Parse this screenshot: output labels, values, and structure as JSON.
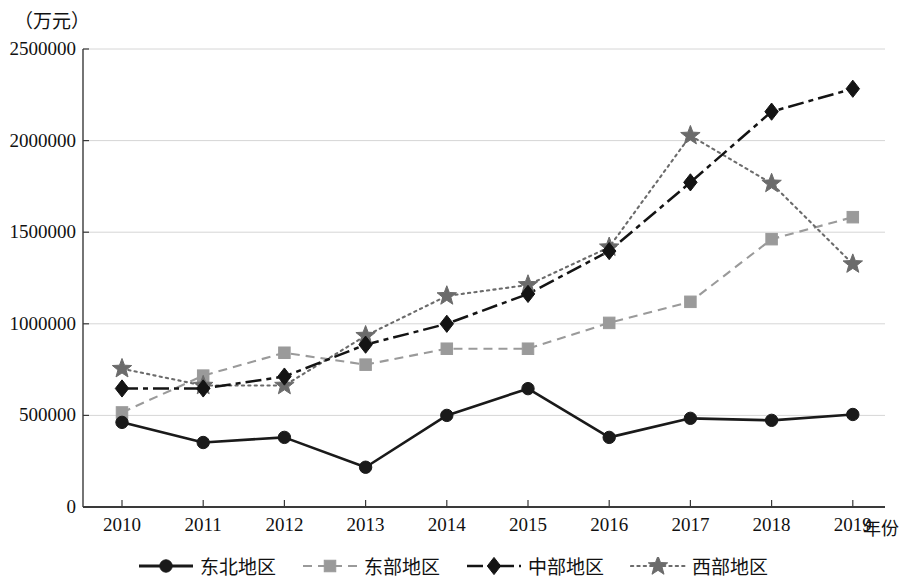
{
  "chart_data": {
    "type": "line",
    "title": "",
    "subtitle": "",
    "xlabel": "年份",
    "ylabel": "（万元）",
    "x": [
      "2010",
      "2011",
      "2012",
      "2013",
      "2014",
      "2015",
      "2016",
      "2017",
      "2018",
      "2019"
    ],
    "categories": [
      "2010",
      "2011",
      "2012",
      "2013",
      "2014",
      "2015",
      "2016",
      "2017",
      "2018",
      "2019"
    ],
    "ylim": [
      0,
      2500000
    ],
    "yticks": [
      "0",
      "500000",
      "1000000",
      "1500000",
      "2000000",
      "2500000"
    ],
    "ytick_values": [
      0,
      500000,
      1000000,
      1500000,
      2000000,
      2500000
    ],
    "grid": "horizontal",
    "legend_position": "bottom",
    "series": [
      {
        "name": "东北地区",
        "marker": "circle",
        "linestyle": "solid",
        "color": "#1a1a1a",
        "values": [
          462000,
          352000,
          380000,
          217000,
          500000,
          646000,
          380000,
          484000,
          473000,
          505000
        ]
      },
      {
        "name": "东部地区",
        "marker": "square",
        "linestyle": "dashed",
        "color": "#9a9a9a",
        "values": [
          516000,
          717000,
          842000,
          777000,
          864000,
          864000,
          1005000,
          1120000,
          1462000,
          1582000
        ]
      },
      {
        "name": "中部地区",
        "marker": "diamond",
        "linestyle": "dashdot",
        "color": "#141414",
        "values": [
          647000,
          647000,
          712000,
          886000,
          1000000,
          1163000,
          1397000,
          1772000,
          2158000,
          2283000
        ]
      },
      {
        "name": "西部地区",
        "marker": "star",
        "linestyle": "dotted",
        "color": "#6b6b6b",
        "values": [
          755000,
          663000,
          663000,
          935000,
          1152000,
          1212000,
          1418000,
          2027000,
          1766000,
          1326000
        ]
      }
    ]
  },
  "axes": {
    "unit_label": "（万元）",
    "x_name": "年份"
  },
  "colors": {
    "axis": "#3a3a3a",
    "grid": "#d6d6d6",
    "northeast": "#1a1a1a",
    "east": "#9a9a9a",
    "central": "#141414",
    "west": "#6b6b6b"
  }
}
